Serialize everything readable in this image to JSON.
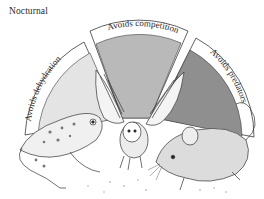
{
  "title": "Nocturnal",
  "segments": [
    {
      "label": "Avoids dehydration",
      "animal": "frog",
      "fill": "#e4e4e4"
    },
    {
      "label": "Avoids competition",
      "animal": "owl",
      "fill": "#b9b9b9"
    },
    {
      "label": "Avoids predators",
      "animal": "mouse",
      "fill": "#8f8f8f"
    }
  ],
  "colors": {
    "band": "#ffffff",
    "outline": "#3a3a3a",
    "background": "#ffffff"
  }
}
